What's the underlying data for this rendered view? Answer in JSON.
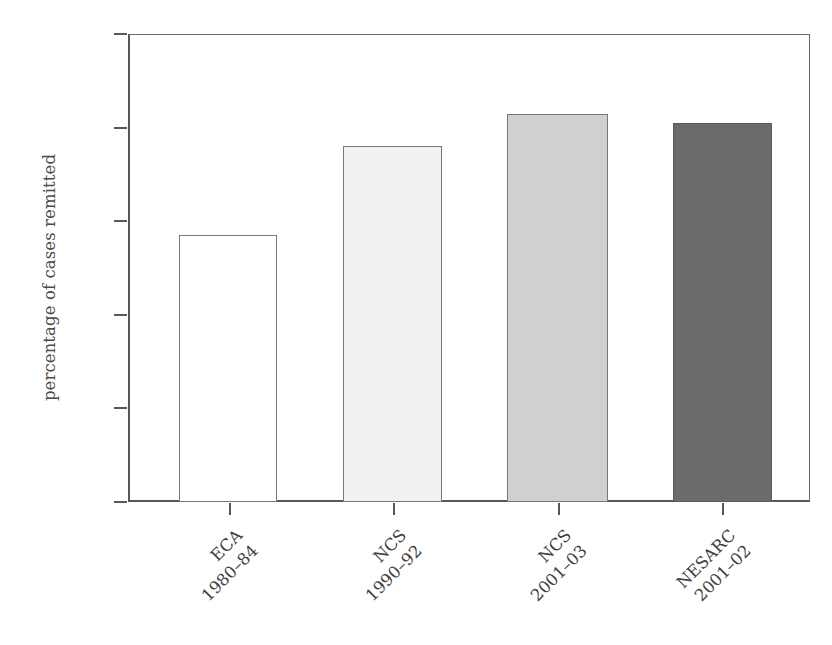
{
  "chart_data": {
    "type": "bar",
    "title": "",
    "subtitle": "",
    "xlabel": "",
    "ylabel": "percentage of cases remitted",
    "ylim": [
      0,
      100
    ],
    "yticks": [
      0,
      20,
      40,
      60,
      80,
      100
    ],
    "ytick_labels": [
      "0",
      "20",
      "40",
      "60",
      "80",
      "100"
    ],
    "grid": false,
    "legend": "none",
    "categories": [
      "ECA 1980–84",
      "NCS 1990–92",
      "NCS 2001–03",
      "NESARC 2001–02"
    ],
    "values": [
      57,
      76,
      83,
      81
    ],
    "bars": [
      {
        "study": "ECA",
        "period": "1980–84",
        "value": 57,
        "fill": "#ffffff",
        "stroke": "#777777"
      },
      {
        "study": "NCS",
        "period": "1990–92",
        "value": 76,
        "fill": "#f1f1f1",
        "stroke": "#777777"
      },
      {
        "study": "NCS",
        "period": "2001–03",
        "value": 83,
        "fill": "#d0d0d0",
        "stroke": "#777777"
      },
      {
        "study": "NESARC",
        "period": "2001–02",
        "value": 81,
        "fill": "#6b6b6b",
        "stroke": "#5a5a5a"
      }
    ],
    "axis_color": "#585858",
    "text_color": "#3f3f3f",
    "background": "#ffffff"
  }
}
